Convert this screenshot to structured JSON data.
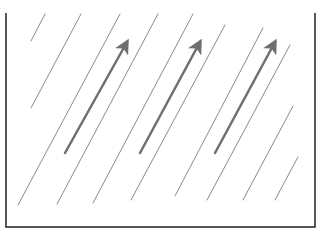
{
  "diagram": {
    "width": 321,
    "height": 236,
    "colors": {
      "background": "#ffffff",
      "frame": "#222222",
      "thin_line": "#8a8a8a",
      "arrow": "#6f6f6f"
    },
    "frame": {
      "left": 6,
      "right": 315,
      "top": 13,
      "bottom": 227,
      "open_top": true,
      "stroke_width": 1.5
    },
    "thin_lines": [
      {
        "x1": 31,
        "y1": 41,
        "x2": 45,
        "y2": 14
      },
      {
        "x1": 31,
        "y1": 108,
        "x2": 81,
        "y2": 14
      },
      {
        "x1": 18,
        "y1": 205,
        "x2": 120,
        "y2": 14
      },
      {
        "x1": 57,
        "y1": 204,
        "x2": 158,
        "y2": 14
      },
      {
        "x1": 93,
        "y1": 203,
        "x2": 193,
        "y2": 14
      },
      {
        "x1": 131,
        "y1": 200,
        "x2": 225,
        "y2": 25
      },
      {
        "x1": 175,
        "y1": 196,
        "x2": 263,
        "y2": 28
      },
      {
        "x1": 207,
        "y1": 200,
        "x2": 290,
        "y2": 45
      },
      {
        "x1": 243,
        "y1": 200,
        "x2": 293,
        "y2": 106
      },
      {
        "x1": 275,
        "y1": 200,
        "x2": 298,
        "y2": 157
      }
    ],
    "arrows": [
      {
        "x1": 65,
        "y1": 153,
        "x2": 127,
        "y2": 42
      },
      {
        "x1": 140,
        "y1": 153,
        "x2": 200,
        "y2": 42
      },
      {
        "x1": 215,
        "y1": 153,
        "x2": 275,
        "y2": 42
      }
    ]
  }
}
